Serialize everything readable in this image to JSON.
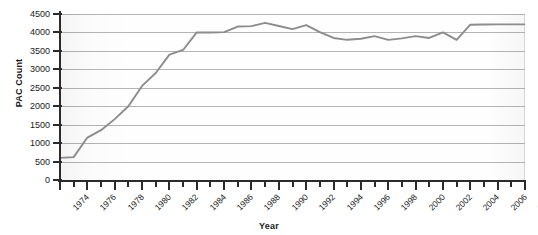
{
  "chart_data": {
    "type": "line",
    "title": "",
    "xlabel": "Year",
    "ylabel": "PAC Count",
    "xlim": [
      1974,
      2008
    ],
    "ylim": [
      0,
      4500
    ],
    "grid": true,
    "legend": false,
    "line_color": "#8c8c8c",
    "x_tick_labels": [
      "1974",
      "1976",
      "1978",
      "1980",
      "1982",
      "1984",
      "1986",
      "1988",
      "1990",
      "1992",
      "1994",
      "1996",
      "1998",
      "2000",
      "2002",
      "2004",
      "2006",
      "2008"
    ],
    "x_tick_step": 2,
    "x_minor_tick_step": 1,
    "y_tick_labels": [
      "0",
      "500",
      "1000",
      "1500",
      "2000",
      "2500",
      "3000",
      "3500",
      "4000",
      "4500"
    ],
    "y_tick_step": 500,
    "series": [
      {
        "name": "PAC Count",
        "x": [
          1974,
          1975,
          1976,
          1977,
          1978,
          1979,
          1980,
          1981,
          1982,
          1983,
          1984,
          1985,
          1986,
          1987,
          1988,
          1989,
          1990,
          1991,
          1992,
          1993,
          1994,
          1995,
          1996,
          1997,
          1998,
          1999,
          2000,
          2001,
          2002,
          2003,
          2004,
          2005,
          2006,
          2007,
          2008
        ],
        "values": [
          600,
          620,
          1150,
          1350,
          1650,
          2000,
          2550,
          2900,
          3400,
          3525,
          4000,
          4000,
          4010,
          4160,
          4170,
          4260,
          4175,
          4090,
          4200,
          4010,
          3850,
          3800,
          3830,
          3900,
          3800,
          3840,
          3900,
          3850,
          4000,
          3800,
          4210,
          4215,
          4220,
          4220,
          4220
        ]
      }
    ]
  }
}
